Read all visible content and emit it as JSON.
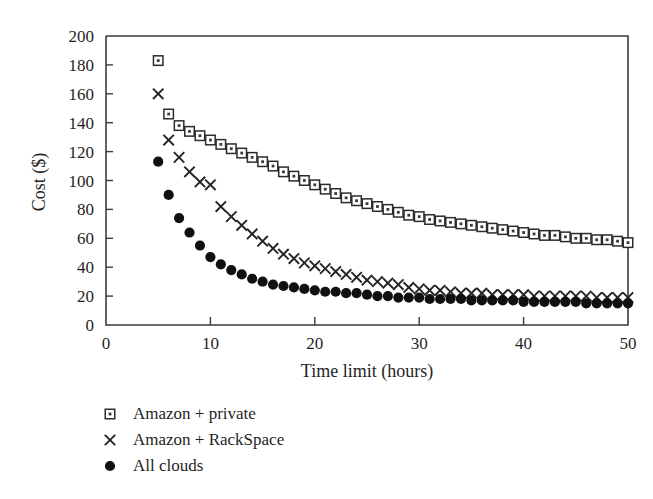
{
  "chart_data": {
    "type": "scatter",
    "title": "",
    "xlabel": "Time limit (hours)",
    "ylabel": "Cost ($)",
    "xlim": [
      0,
      50
    ],
    "ylim": [
      0,
      200
    ],
    "xticks": [
      0,
      10,
      20,
      30,
      40,
      50
    ],
    "yticks": [
      0,
      20,
      40,
      60,
      80,
      100,
      120,
      140,
      160,
      180,
      200
    ],
    "grid": false,
    "legend_position": "below-left",
    "x": [
      5,
      6,
      7,
      8,
      9,
      10,
      11,
      12,
      13,
      14,
      15,
      16,
      17,
      18,
      19,
      20,
      21,
      22,
      23,
      24,
      25,
      26,
      27,
      28,
      29,
      30,
      31,
      32,
      33,
      34,
      35,
      36,
      37,
      38,
      39,
      40,
      41,
      42,
      43,
      44,
      45,
      46,
      47,
      48,
      49,
      50
    ],
    "series": [
      {
        "name": "Amazon + private",
        "marker": "open-square",
        "values": [
          183,
          146,
          138,
          134,
          131,
          128,
          125,
          122,
          119,
          116,
          113,
          110,
          106,
          103,
          100,
          97,
          94,
          91,
          88,
          86,
          84,
          82,
          80,
          78,
          76,
          75,
          73,
          72,
          71,
          70,
          69,
          68,
          67,
          66,
          65,
          64,
          63,
          62,
          62,
          61,
          60,
          60,
          59,
          59,
          58,
          57
        ]
      },
      {
        "name": "Amazon + RackSpace",
        "marker": "cross",
        "values": [
          160,
          128,
          116,
          106,
          99,
          97,
          82,
          75,
          69,
          63,
          58,
          53,
          49,
          46,
          43,
          41,
          39,
          37,
          35,
          33,
          31,
          30,
          29,
          28,
          26,
          25,
          24,
          24,
          23,
          22,
          22,
          22,
          21,
          21,
          21,
          21,
          20,
          20,
          20,
          20,
          20,
          20,
          19,
          19,
          19,
          19
        ]
      },
      {
        "name": "All clouds",
        "marker": "filled-circle",
        "values": [
          113,
          90,
          74,
          64,
          55,
          47,
          42,
          38,
          35,
          32,
          30,
          28,
          27,
          26,
          25,
          24,
          23,
          23,
          22,
          22,
          21,
          20,
          20,
          19,
          19,
          19,
          18,
          18,
          18,
          18,
          17,
          17,
          17,
          17,
          17,
          16,
          16,
          16,
          16,
          16,
          16,
          15,
          15,
          15,
          15,
          15
        ]
      }
    ]
  },
  "legend": {
    "items": [
      {
        "label": "Amazon + private",
        "marker": "open-square"
      },
      {
        "label": "Amazon + RackSpace",
        "marker": "cross"
      },
      {
        "label": "All clouds",
        "marker": "filled-circle"
      }
    ]
  }
}
